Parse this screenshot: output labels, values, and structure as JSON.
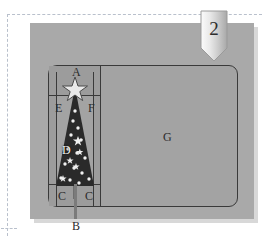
{
  "figure": {
    "badge_number": "2",
    "badge_icon": "ribbon-banner-icon",
    "labels": {
      "a": "A",
      "b": "B",
      "c_left": "C",
      "c_right": "C",
      "d": "D",
      "e": "E",
      "f": "F",
      "g": "G"
    },
    "colors": {
      "panel": "#a9a9a9",
      "panel_shadow": "#d8d8d8",
      "wireframe_stroke": "#3a3a3a",
      "tree_fill": "#2a2a2a",
      "ornament": "#f5f5f5",
      "dashed_guide": "#b9c0cc",
      "background": "#ffffff",
      "cell_shade": "#9c9c9c"
    },
    "diagram": {
      "type": "annotated-wireframe",
      "description": "Christmas tree graphic placed in the left column of a rounded-rectangle layout frame; large empty region G on the right.",
      "regions": [
        {
          "key": "A",
          "role": "top cell above the tree star"
        },
        {
          "key": "E",
          "role": "left cell beside tree top"
        },
        {
          "key": "F",
          "role": "right cell beside tree top"
        },
        {
          "key": "D",
          "role": "star ornament on tree body"
        },
        {
          "key": "C",
          "role": "bottom-left cell"
        },
        {
          "key": "C",
          "role": "bottom-right cell"
        },
        {
          "key": "B",
          "role": "trunk extending below frame"
        },
        {
          "key": "G",
          "role": "large right-hand content area"
        }
      ]
    }
  }
}
